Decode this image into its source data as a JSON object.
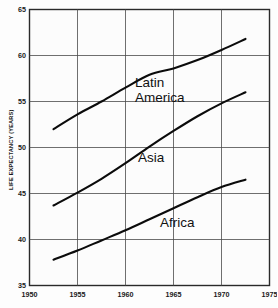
{
  "chart_data": {
    "type": "line",
    "title": "",
    "subtitle": "",
    "xlabel": "",
    "ylabel": "LIFE EXPECTANCY (YEARS)",
    "xlim": [
      1950,
      1975
    ],
    "ylim": [
      35,
      65
    ],
    "x_ticks": [
      "1950",
      "1955",
      "1960",
      "1965",
      "1970",
      "1975"
    ],
    "y_ticks": [
      "35",
      "40",
      "45",
      "50",
      "55",
      "60",
      "65"
    ],
    "grid": true,
    "legend_position": "inline-annotations",
    "series": [
      {
        "name": "Latin America",
        "label_line1": "Latin",
        "label_line2": "America",
        "x": [
          1952.5,
          1955.0,
          1957.5,
          1960.0,
          1962.5,
          1965.0,
          1967.5,
          1970.0,
          1972.5
        ],
        "values": [
          52.0,
          53.6,
          55.0,
          56.5,
          57.9,
          58.6,
          59.5,
          60.6,
          61.8
        ]
      },
      {
        "name": "Asia",
        "label_line1": "Asia",
        "label_line2": "",
        "x": [
          1952.5,
          1955.0,
          1957.5,
          1960.0,
          1962.5,
          1965.0,
          1967.5,
          1970.0,
          1972.5
        ],
        "values": [
          43.7,
          45.1,
          46.6,
          48.3,
          50.1,
          51.8,
          53.4,
          54.8,
          56.0
        ]
      },
      {
        "name": "Africa",
        "label_line1": "Africa",
        "label_line2": "",
        "x": [
          1952.5,
          1955.0,
          1957.5,
          1960.0,
          1962.5,
          1965.0,
          1967.5,
          1970.0,
          1972.5
        ],
        "values": [
          37.8,
          38.8,
          39.9,
          41.0,
          42.2,
          43.4,
          44.6,
          45.7,
          46.5
        ]
      }
    ],
    "annotations": [
      {
        "text": "Latin",
        "x": 1961.0,
        "y": 56.6
      },
      {
        "text": "America",
        "x": 1961.0,
        "y": 55.0
      },
      {
        "text": "Asia",
        "x": 1961.3,
        "y": 48.4
      },
      {
        "text": "Africa",
        "x": 1963.6,
        "y": 41.4
      }
    ],
    "colors": {
      "line": "#0b0b0b",
      "grid": "#4a4a4a",
      "frame": "#2a2a2a",
      "background": "#fdfdfd",
      "plot_background": "#fcfcfc",
      "text": "#111111"
    }
  }
}
